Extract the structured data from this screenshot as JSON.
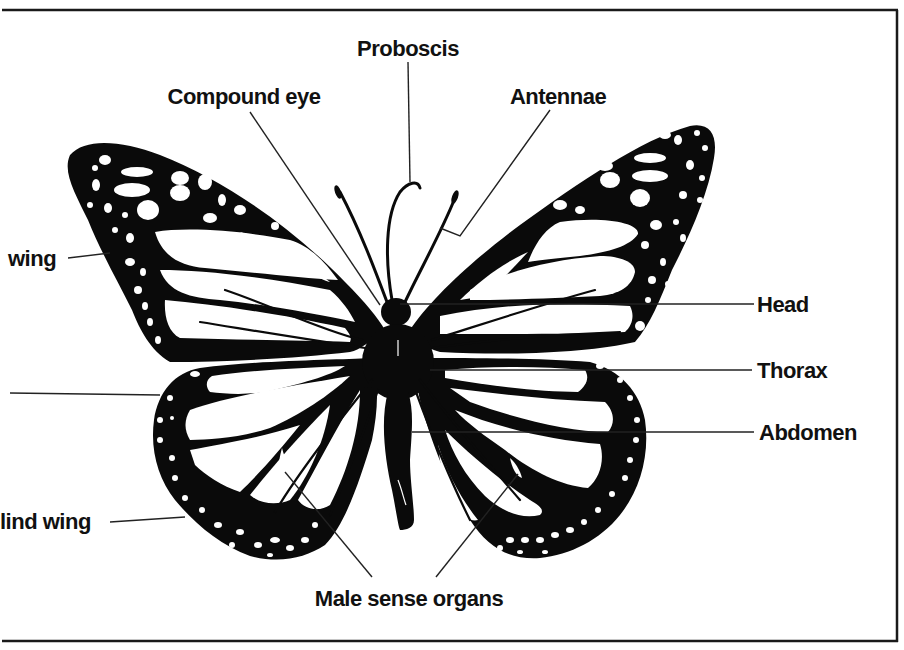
{
  "diagram": {
    "colors": {
      "ink": "#0a0a0a",
      "paper": "#ffffff",
      "frame": "#1a1a1a"
    },
    "labels": {
      "proboscis": "Proboscis",
      "compound_eye": "Compound eye",
      "antennae": "Antennae",
      "fore_wing": "wing",
      "hind_wing": "lind wing",
      "head": "Head",
      "thorax": "Thorax",
      "abdomen": "Abdomen",
      "male_sense_organs": "Male sense organs"
    }
  }
}
